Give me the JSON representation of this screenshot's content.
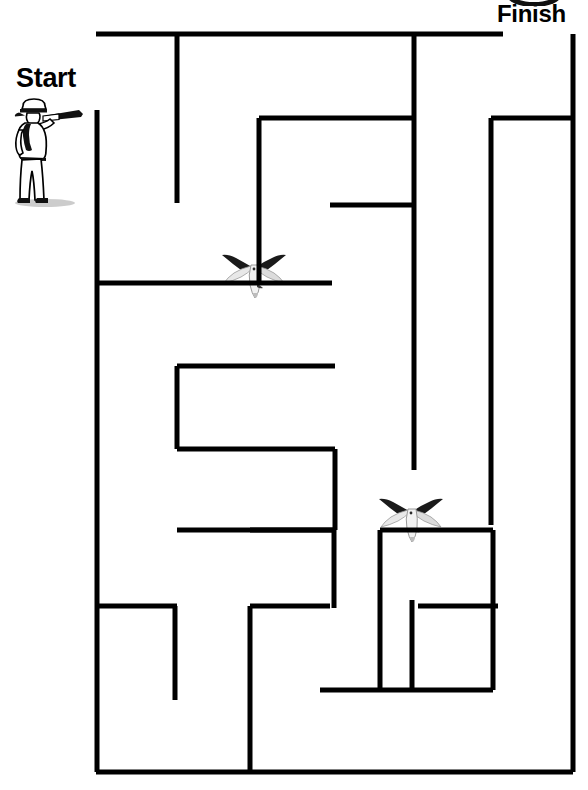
{
  "page": {
    "width": 588,
    "height": 790,
    "background_color": "#ffffff",
    "wall_color": "#000000",
    "wall_thickness": 5
  },
  "labels": {
    "start": "Start",
    "finish": "Finish"
  },
  "decorations": {
    "start_figure": {
      "name": "sailor-with-telescope",
      "description": "Sailor in white uniform and cap looking through a spyglass",
      "x": 7,
      "y": 90,
      "width": 82,
      "height": 118
    },
    "birds": [
      {
        "name": "seagull-upper",
        "x": 218,
        "y": 253,
        "width": 72,
        "height": 46
      },
      {
        "name": "seagull-lower",
        "x": 375,
        "y": 497,
        "width": 72,
        "height": 46
      }
    ],
    "top_clip_art": {
      "name": "cropped-badge",
      "x": 505,
      "y": -14,
      "width": 58,
      "height": 20
    }
  },
  "maze": {
    "entrance": {
      "label": "Start",
      "side": "left",
      "x": 97,
      "y": 70
    },
    "exit": {
      "label": "Finish",
      "side": "top-right",
      "x": 573,
      "y": 34
    },
    "bounds": {
      "left": 96,
      "top": 34,
      "right": 573,
      "bottom": 772
    },
    "walls": [
      {
        "id": "w01",
        "orient": "h",
        "x1": 96,
        "x2": 503,
        "y": 34
      },
      {
        "id": "w02",
        "orient": "v",
        "x": 573,
        "y1": 34,
        "y2": 772
      },
      {
        "id": "w03",
        "orient": "h",
        "x1": 96,
        "x2": 573,
        "y": 772
      },
      {
        "id": "w04",
        "orient": "v",
        "x": 97,
        "y1": 110,
        "y2": 772
      },
      {
        "id": "w05",
        "orient": "v",
        "x": 177,
        "y1": 34,
        "y2": 203
      },
      {
        "id": "w06",
        "orient": "v",
        "x": 414,
        "y1": 34,
        "y2": 470
      },
      {
        "id": "w07",
        "orient": "h",
        "x1": 259,
        "x2": 414,
        "y": 118
      },
      {
        "id": "w08",
        "orient": "v",
        "x": 259,
        "y1": 118,
        "y2": 283
      },
      {
        "id": "w09",
        "orient": "h",
        "x1": 330,
        "x2": 414,
        "y": 205
      },
      {
        "id": "w10",
        "orient": "h",
        "x1": 97,
        "x2": 332,
        "y": 283
      },
      {
        "id": "w11",
        "orient": "h",
        "x1": 177,
        "x2": 335,
        "y": 366
      },
      {
        "id": "w12",
        "orient": "v",
        "x": 177,
        "y1": 366,
        "y2": 449
      },
      {
        "id": "w13",
        "orient": "h",
        "x1": 177,
        "x2": 335,
        "y": 449
      },
      {
        "id": "w14",
        "orient": "v",
        "x": 335,
        "y1": 449,
        "y2": 530
      },
      {
        "id": "w15",
        "orient": "h",
        "x1": 177,
        "x2": 335,
        "y": 530
      },
      {
        "id": "w16",
        "orient": "v",
        "x": 491,
        "y1": 118,
        "y2": 525
      },
      {
        "id": "w17",
        "orient": "h",
        "x1": 491,
        "x2": 573,
        "y": 118
      },
      {
        "id": "w18",
        "orient": "h",
        "x1": 380,
        "x2": 493,
        "y": 530
      },
      {
        "id": "w19",
        "orient": "v",
        "x": 493,
        "y1": 530,
        "y2": 690
      },
      {
        "id": "w20",
        "orient": "h",
        "x1": 320,
        "x2": 493,
        "y": 690
      },
      {
        "id": "w21",
        "orient": "v",
        "x": 380,
        "y1": 530,
        "y2": 690
      },
      {
        "id": "w22",
        "orient": "v",
        "x": 412,
        "y1": 600,
        "y2": 690
      },
      {
        "id": "w23",
        "orient": "h",
        "x1": 97,
        "x2": 177,
        "y": 606
      },
      {
        "id": "w24",
        "orient": "v",
        "x": 175,
        "y1": 606,
        "y2": 700
      },
      {
        "id": "w25",
        "orient": "h",
        "x1": 250,
        "x2": 330,
        "y": 606
      },
      {
        "id": "w26",
        "orient": "v",
        "x": 250,
        "y1": 606,
        "y2": 772
      },
      {
        "id": "w27",
        "orient": "h",
        "x1": 250,
        "x2": 334,
        "y": 530
      },
      {
        "id": "w28",
        "orient": "v",
        "x": 334,
        "y1": 530,
        "y2": 608
      },
      {
        "id": "w29",
        "orient": "h",
        "x1": 418,
        "x2": 498,
        "y": 606
      }
    ]
  }
}
